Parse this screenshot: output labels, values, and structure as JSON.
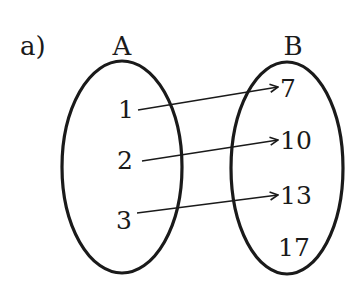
{
  "part_label": "a)",
  "sets": [
    {
      "name": "A",
      "elements": [
        "1",
        "2",
        "3"
      ]
    },
    {
      "name": "B",
      "elements": [
        "7",
        "10",
        "13",
        "17"
      ]
    }
  ],
  "mapping": [
    {
      "from": "1",
      "to": "7"
    },
    {
      "from": "2",
      "to": "10"
    },
    {
      "from": "3",
      "to": "13"
    }
  ],
  "colors": {
    "stroke": "#1a1a1a",
    "background": "#ffffff"
  }
}
